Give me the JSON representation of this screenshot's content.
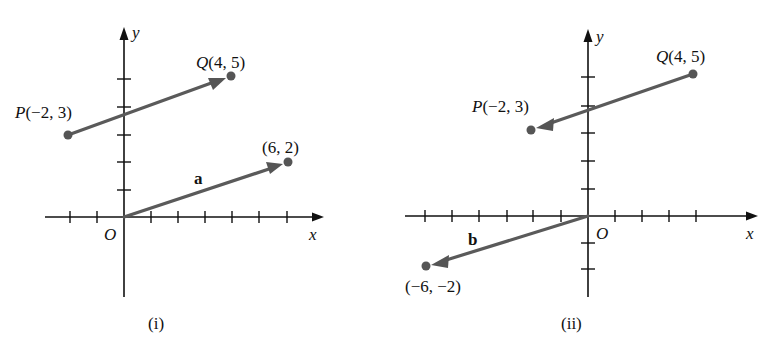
{
  "panels": [
    {
      "id": "i",
      "caption": "(i)",
      "axes": {
        "x_label": "x",
        "y_label": "y",
        "origin_label": "O"
      },
      "points": [
        {
          "name": "P",
          "coords": "(−2, 3)",
          "x": -2,
          "y": 3
        },
        {
          "name": "Q",
          "coords": "(4, 5)",
          "x": 4,
          "y": 5
        },
        {
          "name": "",
          "coords": "(6, 2)",
          "x": 6,
          "y": 2
        }
      ],
      "vectors": [
        {
          "label": "",
          "from": [
            -2,
            3
          ],
          "to": [
            4,
            5
          ]
        },
        {
          "label": "a",
          "from": [
            0,
            0
          ],
          "to": [
            6,
            2
          ]
        }
      ]
    },
    {
      "id": "ii",
      "caption": "(ii)",
      "axes": {
        "x_label": "x",
        "y_label": "y",
        "origin_label": "O"
      },
      "points": [
        {
          "name": "P",
          "coords": "(−2, 3)",
          "x": -2,
          "y": 3
        },
        {
          "name": "Q",
          "coords": "(4, 5)",
          "x": 4,
          "y": 5
        },
        {
          "name": "",
          "coords": "(−6, −2)",
          "x": -6,
          "y": -2
        }
      ],
      "vectors": [
        {
          "label": "",
          "from": [
            4,
            5
          ],
          "to": [
            -2,
            3
          ]
        },
        {
          "label": "b",
          "from": [
            0,
            0
          ],
          "to": [
            -6,
            -2
          ]
        }
      ]
    }
  ],
  "colors": {
    "axis": "#111111",
    "vector": "#5a5a5a",
    "point": "#555555"
  }
}
